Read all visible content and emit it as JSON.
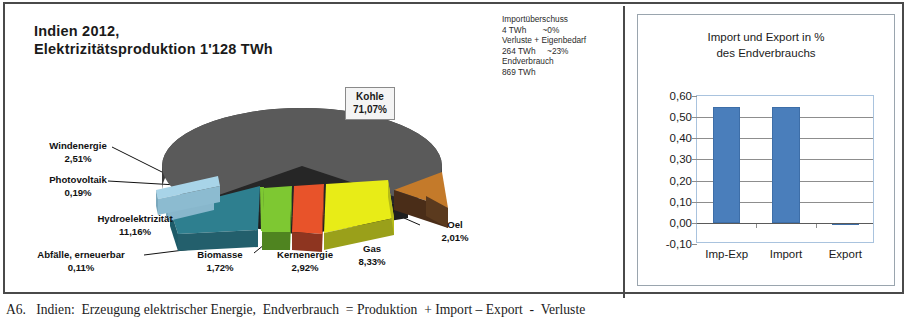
{
  "figure": {
    "caption": "A6.   Indien:  Erzeugung elektrischer Energie,  Endverbrauch  = Produktion  + Import – Export  -  Verluste"
  },
  "pie_panel": {
    "title": "Indien 2012,\nElektrizitätsproduktion 1'128 TWh",
    "balance_note": {
      "line1": "Importüberschuss",
      "line2": "4 TWh       ~0%",
      "line3": "Verluste + Eigenbedarf",
      "line4": "264 TWh     ~23%",
      "line5": "Endverbrauch",
      "line6": "869 TWh"
    },
    "callout": {
      "name": "Kohle",
      "value": "71,07%"
    },
    "labels": {
      "wind": "Windenergie\n2,51%",
      "photovoltaik": "Photovoltaik\n0,19%",
      "hydro": "Hydroelektrizität\n11,16%",
      "waste": "Abfälle, erneuerbar\n0,11%",
      "biomass": "Biomasse\n1,72%",
      "nuclear": "Kernenergie\n2,92%",
      "gas": "Gas\n8,33%",
      "oil": "Oel\n2,01%"
    }
  },
  "bar_panel": {
    "title": "Import und Export in %\ndes Endverbrauchs"
  },
  "chart_data": [
    {
      "type": "pie",
      "title": "Indien 2012, Elektrizitätsproduktion 1'128 TWh",
      "unit": "%",
      "total_label": "1'128 TWh",
      "categories": [
        "Kohle",
        "Hydroelektrizität",
        "Gas",
        "Kernenergie",
        "Windenergie",
        "Oel",
        "Biomasse",
        "Photovoltaik",
        "Abfälle, erneuerbar"
      ],
      "values": [
        71.07,
        11.16,
        8.33,
        2.92,
        2.51,
        2.01,
        1.72,
        0.19,
        0.11
      ],
      "colors": [
        "#5a5a5a",
        "#2e7f8f",
        "#e8ec17",
        "#e8532a",
        "#a8d4e8",
        "#c47a2a",
        "#7ec832",
        "#a8d4e8",
        "#7ec832"
      ],
      "exploded": true,
      "three_d": true,
      "legend": "none"
    },
    {
      "type": "bar",
      "title": "Import und Export in % des Endverbrauchs",
      "categories": [
        "Imp-Exp",
        "Import",
        "Export"
      ],
      "values": [
        0.55,
        0.55,
        -0.01
      ],
      "ylim": [
        -0.1,
        0.6
      ],
      "yticks": [
        "0,60",
        "0,50",
        "0,40",
        "0,30",
        "0,20",
        "0,10",
        "0,00",
        "-0,10"
      ],
      "ytick_values": [
        0.6,
        0.5,
        0.4,
        0.3,
        0.2,
        0.1,
        0.0,
        -0.1
      ],
      "xlabel": "",
      "ylabel": "",
      "grid": true,
      "legend": "none",
      "series_color": "#4a7ebb"
    }
  ]
}
